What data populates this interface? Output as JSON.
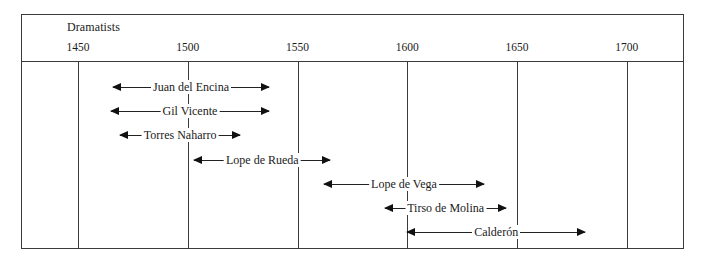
{
  "chart_data": {
    "type": "timeline",
    "title": "Dramatists",
    "xlabel": "",
    "ylabel": "",
    "xlim": [
      1450,
      1700
    ],
    "grid": true,
    "ticks": [
      1450,
      1500,
      1550,
      1600,
      1650,
      1700
    ],
    "tick_labels": [
      "1450",
      "1500",
      "1550",
      "1600",
      "1650",
      "1700"
    ],
    "series": [
      {
        "name": "Juan del Encina",
        "start": 1466,
        "end": 1537
      },
      {
        "name": "Gil Vicente",
        "start": 1465,
        "end": 1537
      },
      {
        "name": "Torres Naharro",
        "start": 1469,
        "end": 1524
      },
      {
        "name": "Lope de Rueda",
        "start": 1503,
        "end": 1565
      },
      {
        "name": "Lope de Vega",
        "start": 1562,
        "end": 1635
      },
      {
        "name": "Tirso de Molina",
        "start": 1590,
        "end": 1645
      },
      {
        "name": "Calderón",
        "start": 1600,
        "end": 1681
      }
    ]
  },
  "layout": {
    "px_origin": 78,
    "px_per_year": 2.195,
    "row_top": 80,
    "row_step": 24.2
  }
}
